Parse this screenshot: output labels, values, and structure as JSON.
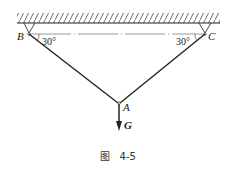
{
  "figure": {
    "caption": "图   4-5",
    "labels": {
      "B": "B",
      "C": "C",
      "A": "A",
      "G": "G"
    },
    "angles": {
      "at_B": "30°",
      "at_C": "30°"
    }
  }
}
